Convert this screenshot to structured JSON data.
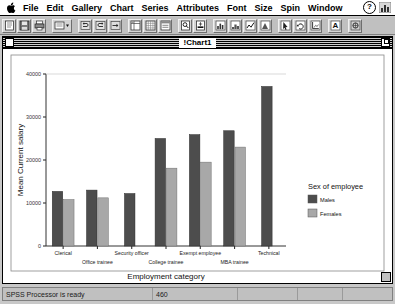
{
  "menubar": {
    "apple_icon": "apple-icon",
    "items": [
      {
        "label": "File"
      },
      {
        "label": "Edit"
      },
      {
        "label": "Gallery"
      },
      {
        "label": "Chart"
      },
      {
        "label": "Series"
      },
      {
        "label": "Attributes"
      },
      {
        "label": "Font"
      },
      {
        "label": "Size"
      },
      {
        "label": "Spin"
      },
      {
        "label": "Window"
      }
    ],
    "help_label": "?",
    "help_icon": "question-mark-icon",
    "applications_icon": "applications-menu-icon"
  },
  "toolbar": {
    "buttons": [
      {
        "name": "new-document-button",
        "icon": "new-document-icon"
      },
      {
        "name": "save-button",
        "icon": "floppy-disk-icon"
      },
      {
        "name": "print-button",
        "icon": "printer-icon"
      },
      {
        "name": "select-cases-button",
        "icon": "select-cases-icon"
      },
      {
        "name": "dropdown-button",
        "icon": "chevron-down-icon"
      },
      {
        "name": "undo-button",
        "icon": "undo-icon"
      },
      {
        "name": "redo-button",
        "icon": "redo-icon"
      },
      {
        "name": "goto-case-button",
        "icon": "goto-case-icon"
      },
      {
        "name": "variables-button",
        "icon": "variables-icon"
      },
      {
        "name": "grid-button",
        "icon": "grid-icon"
      },
      {
        "name": "value-labels-button",
        "icon": "value-labels-icon"
      },
      {
        "name": "find-button",
        "icon": "find-icon"
      },
      {
        "name": "insert-case-button",
        "icon": "insert-case-icon"
      },
      {
        "name": "bar-chart-button",
        "icon": "bar-chart-icon"
      },
      {
        "name": "histogram-button",
        "icon": "histogram-icon"
      },
      {
        "name": "line-chart-button",
        "icon": "line-chart-icon"
      },
      {
        "name": "area-chart-button",
        "icon": "area-chart-icon"
      },
      {
        "name": "pointer-button",
        "icon": "pointer-icon"
      },
      {
        "name": "rotate-button",
        "icon": "rotate-icon"
      },
      {
        "name": "axis-button",
        "icon": "axis-icon"
      },
      {
        "name": "text-tool-button",
        "icon": "text-a-icon"
      },
      {
        "name": "spin-button",
        "icon": "spin-icon"
      }
    ]
  },
  "window": {
    "title": "!Chart1",
    "close_icon": "close-box-icon",
    "zoom_icon": "zoom-box-icon"
  },
  "statusbar": {
    "cells": [
      {
        "text": "SPSS Processor is ready"
      },
      {
        "text": "460"
      },
      {
        "text": ""
      },
      {
        "text": ""
      },
      {
        "text": ""
      }
    ]
  },
  "chart_data": {
    "type": "bar",
    "title": "",
    "xlabel": "Employment category",
    "ylabel": "Mean Current salary",
    "ylim": [
      0,
      40000
    ],
    "yticks": [
      0,
      10000,
      20000,
      30000,
      40000
    ],
    "ytick_labels": [
      "0",
      "10000",
      "20000",
      "30000",
      "40000"
    ],
    "grid": false,
    "legend": {
      "title": "Sex of employee",
      "position": "right",
      "entries": [
        {
          "name": "Males",
          "color": "#4d4d4d"
        },
        {
          "name": "Females",
          "color": "#a8a8a8"
        }
      ]
    },
    "categories": [
      "Clerical",
      "Office trainee",
      "Security officer",
      "College trainee",
      "Exempt employee",
      "MBA trainee",
      "Technical"
    ],
    "series": [
      {
        "name": "Males",
        "color": "#4d4d4d",
        "values": [
          12700,
          13000,
          12200,
          25000,
          25900,
          26800,
          37100
        ]
      },
      {
        "name": "Females",
        "color": "#a8a8a8",
        "values": [
          10800,
          11200,
          null,
          18100,
          19500,
          23000,
          null
        ]
      }
    ]
  }
}
